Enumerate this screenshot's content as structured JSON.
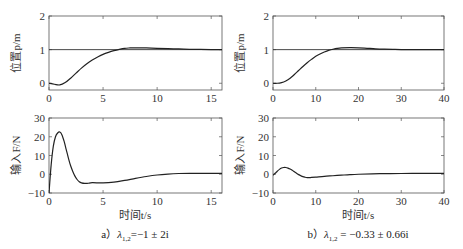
{
  "chart_data": [
    {
      "type": "line",
      "panel": "a-top",
      "title": "",
      "xlabel": "",
      "ylabel": "位置p/m",
      "xlim": [
        0,
        16
      ],
      "ylim": [
        -0.2,
        2
      ],
      "xticks": [
        0,
        5,
        10,
        15
      ],
      "yticks": [
        0,
        1,
        2
      ],
      "grid": false,
      "series": [
        {
          "name": "reference",
          "x": [
            0,
            16
          ],
          "y": [
            1,
            1
          ]
        },
        {
          "name": "position",
          "x": [
            0,
            0.5,
            1,
            1.5,
            2,
            2.5,
            3,
            3.5,
            4,
            4.5,
            5,
            5.5,
            6,
            6.5,
            7,
            7.5,
            8,
            9,
            10,
            11,
            12,
            13,
            14,
            15,
            16
          ],
          "y": [
            0,
            -0.03,
            -0.05,
            0.02,
            0.15,
            0.3,
            0.45,
            0.58,
            0.69,
            0.78,
            0.86,
            0.92,
            0.97,
            1.01,
            1.04,
            1.05,
            1.055,
            1.05,
            1.04,
            1.03,
            1.02,
            1.01,
            1.005,
            1.0,
            1.0
          ]
        }
      ]
    },
    {
      "type": "line",
      "panel": "a-bottom",
      "title": "",
      "xlabel": "时间t/s",
      "ylabel": "输入F/N",
      "xlim": [
        0,
        16
      ],
      "ylim": [
        -10,
        30
      ],
      "xticks": [
        0,
        5,
        10,
        15
      ],
      "yticks": [
        -10,
        0,
        10,
        20,
        30
      ],
      "grid": false,
      "series": [
        {
          "name": "input",
          "x": [
            0,
            0.2,
            0.4,
            0.6,
            0.8,
            1.0,
            1.2,
            1.4,
            1.6,
            1.8,
            2.0,
            2.2,
            2.4,
            2.6,
            2.8,
            3.0,
            3.3,
            3.6,
            4,
            5,
            6,
            7,
            8,
            9,
            10,
            11,
            12,
            13,
            14,
            15,
            16
          ],
          "y": [
            -10,
            5,
            15,
            20,
            22,
            22.5,
            21,
            17.5,
            13,
            8.5,
            4.5,
            1.5,
            -1,
            -2.8,
            -4,
            -4.6,
            -4.9,
            -4.8,
            -4.5,
            -4.6,
            -4.2,
            -3.3,
            -2.2,
            -1.2,
            -0.4,
            0.1,
            0.4,
            0.5,
            0.5,
            0.5,
            0.5
          ]
        }
      ]
    },
    {
      "type": "line",
      "panel": "b-top",
      "title": "",
      "xlabel": "",
      "ylabel": "位置p/m",
      "xlim": [
        0,
        40
      ],
      "ylim": [
        -0.2,
        2
      ],
      "xticks": [
        0,
        10,
        20,
        30,
        40
      ],
      "yticks": [
        0,
        1,
        2
      ],
      "grid": false,
      "series": [
        {
          "name": "reference",
          "x": [
            0,
            40
          ],
          "y": [
            1,
            1
          ]
        },
        {
          "name": "position",
          "x": [
            0,
            1,
            2,
            3,
            4,
            5,
            6,
            7,
            8,
            9,
            10,
            11,
            12,
            13,
            14,
            15,
            16,
            18,
            20,
            22,
            24,
            26,
            28,
            30,
            35,
            40
          ],
          "y": [
            0,
            0,
            0.02,
            0.07,
            0.15,
            0.26,
            0.38,
            0.5,
            0.61,
            0.71,
            0.8,
            0.87,
            0.93,
            0.98,
            1.01,
            1.035,
            1.05,
            1.06,
            1.055,
            1.04,
            1.025,
            1.015,
            1.008,
            1.003,
            1.0,
            1.0
          ]
        }
      ]
    },
    {
      "type": "line",
      "panel": "b-bottom",
      "title": "",
      "xlabel": "时间t/s",
      "ylabel": "输入F/N",
      "xlim": [
        0,
        40
      ],
      "ylim": [
        -10,
        30
      ],
      "xticks": [
        0,
        10,
        20,
        30,
        40
      ],
      "yticks": [
        -10,
        0,
        10,
        20,
        30
      ],
      "grid": false,
      "series": [
        {
          "name": "input",
          "x": [
            0,
            0.5,
            1,
            1.5,
            2,
            2.5,
            3,
            3.5,
            4,
            4.5,
            5,
            5.5,
            6,
            6.5,
            7,
            7.5,
            8,
            8.5,
            9,
            10,
            12,
            14,
            16,
            18,
            20,
            25,
            30,
            35,
            40
          ],
          "y": [
            -0.5,
            0.5,
            1.6,
            2.6,
            3.3,
            3.6,
            3.6,
            3.3,
            2.8,
            2.1,
            1.3,
            0.5,
            -0.2,
            -0.8,
            -1.3,
            -1.6,
            -1.8,
            -1.8,
            -1.7,
            -1.5,
            -1.1,
            -0.8,
            -0.5,
            -0.2,
            0.0,
            0.3,
            0.4,
            0.5,
            0.5
          ]
        }
      ]
    }
  ],
  "captions": {
    "a": {
      "prefix": "a）",
      "lambda": "λ",
      "sub": "1,2",
      "text": "=−1 ± 2i"
    },
    "b": {
      "prefix": "b）",
      "lambda": "λ",
      "sub": "1,2",
      "text": " = −0.33 ± 0.66i"
    }
  }
}
